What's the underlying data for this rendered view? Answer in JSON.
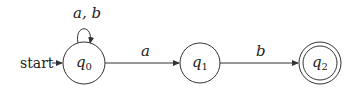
{
  "diagram": {
    "type": "finite-automaton",
    "start_label": "start",
    "states": [
      {
        "id": "q0",
        "name": "q",
        "sub": "0",
        "accepting": false,
        "start": true
      },
      {
        "id": "q1",
        "name": "q",
        "sub": "1",
        "accepting": false,
        "start": false
      },
      {
        "id": "q2",
        "name": "q",
        "sub": "2",
        "accepting": true,
        "start": false
      }
    ],
    "transitions": [
      {
        "from": "q0",
        "to": "q0",
        "label": "a, b"
      },
      {
        "from": "q0",
        "to": "q1",
        "label": "a"
      },
      {
        "from": "q1",
        "to": "q2",
        "label": "b"
      }
    ],
    "colors": {
      "stroke": "#333333",
      "text": "#222222",
      "background": "#ffffff"
    }
  }
}
